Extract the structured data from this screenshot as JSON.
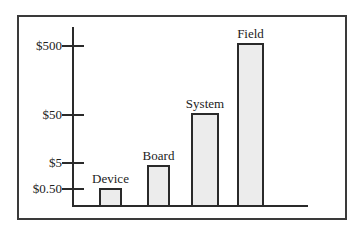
{
  "chart_data": {
    "type": "bar",
    "title": "",
    "xlabel": "",
    "ylabel": "Cost",
    "scale": "log",
    "categories": [
      "Device",
      "Board",
      "System",
      "Field"
    ],
    "values": [
      0.5,
      5,
      50,
      500
    ],
    "yticks": [
      "$0.50",
      "$5",
      "$50",
      "$500"
    ],
    "ylim": [
      0.1,
      1000
    ],
    "grid": false,
    "legend": null
  },
  "axis": {
    "ticks": [
      {
        "label": "$500",
        "y": 45
      },
      {
        "label": "$50",
        "y": 114
      },
      {
        "label": "$5",
        "y": 162
      },
      {
        "label": "$0.50",
        "y": 188
      }
    ]
  },
  "bars": [
    {
      "label": "Device",
      "left": 99,
      "width": 23,
      "top": 188
    },
    {
      "label": "Board",
      "left": 147,
      "width": 23,
      "top": 165
    },
    {
      "label": "System",
      "left": 191,
      "width": 28,
      "top": 113
    },
    {
      "label": "Field",
      "left": 237,
      "width": 27,
      "top": 43
    }
  ],
  "colors": {
    "bar_fill": "#ececec",
    "stroke": "#2a2a2a"
  }
}
